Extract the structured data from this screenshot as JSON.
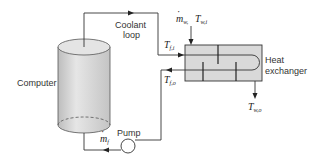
{
  "diagram": {
    "components": {
      "computer": {
        "label": "Computer"
      },
      "coolant_loop": {
        "label_line1": "Coolant",
        "label_line2": "loop"
      },
      "heat_exchanger": {
        "label_line1": "Heat",
        "label_line2": "exchanger"
      },
      "pump": {
        "label": "Pump"
      }
    },
    "variables": {
      "water_inlet_mass": {
        "symbol": "m",
        "sub": "w,",
        "dot": true
      },
      "water_inlet_temp": {
        "symbol": "T",
        "sub": "w,i"
      },
      "water_outlet_temp": {
        "symbol": "T",
        "sub": "w,o"
      },
      "fluid_inlet_temp": {
        "symbol": "T",
        "sub": "f,i"
      },
      "fluid_outlet_temp": {
        "symbol": "T",
        "sub": "f,o"
      },
      "fluid_mass_flow": {
        "symbol": "m",
        "sub": "f",
        "dot": true
      }
    },
    "colors": {
      "line": "#333333",
      "cylinder_fill": "#d4d4d4",
      "hx_fill": "#d8d8d8",
      "background": "#ffffff"
    }
  }
}
